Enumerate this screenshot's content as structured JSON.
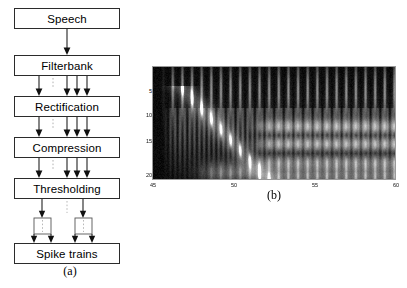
{
  "figure": {
    "panel_a": {
      "caption": "(a)",
      "boxes": [
        {
          "label": "Speech"
        },
        {
          "label": "Filterbank"
        },
        {
          "label": "Rectification"
        },
        {
          "label": "Compression"
        },
        {
          "label": "Thresholding"
        },
        {
          "label": "Spike trains"
        }
      ],
      "connectors": [
        {
          "from": "Speech",
          "to": "Filterbank",
          "arrows": 1,
          "style": "single"
        },
        {
          "from": "Filterbank",
          "to": "Rectification",
          "arrows": 4,
          "style": "multi-with-ellipsis"
        },
        {
          "from": "Rectification",
          "to": "Compression",
          "arrows": 4,
          "style": "multi-with-ellipsis"
        },
        {
          "from": "Compression",
          "to": "Thresholding",
          "arrows": 4,
          "style": "multi-with-ellipsis"
        },
        {
          "from": "Thresholding",
          "to": "Spike trains",
          "arrows": 2,
          "style": "branching-brackets"
        }
      ]
    },
    "panel_b": {
      "caption": "(b)",
      "plot_bg": "#070707",
      "frame_color": "#9a9a9a"
    }
  },
  "chart_data": {
    "type": "heatmap",
    "title": "",
    "subtitle": "",
    "xlabel": "",
    "ylabel": "",
    "xticks": [
      45,
      50,
      55,
      60
    ],
    "yticks": [
      5,
      10,
      15,
      20
    ],
    "xlim": [
      45,
      60
    ],
    "ylim": [
      20,
      1
    ],
    "grid": false,
    "legend": "none",
    "colormap": "gray",
    "features": [
      {
        "name": "formant-sweep",
        "start_x": 47.0,
        "start_y": 5,
        "end_x": 52.0,
        "end_y": 20,
        "intensity": "high"
      },
      {
        "name": "glottal-striations",
        "x_range": [
          45.5,
          60.0
        ],
        "y_range": [
          1,
          9
        ],
        "intensity": "medium"
      },
      {
        "name": "harmonic-bands",
        "x_range": [
          51.5,
          60.0
        ],
        "y_range": [
          9,
          18
        ],
        "intensity": "high"
      },
      {
        "name": "low-channel-band",
        "x_range": [
          48.0,
          60.0
        ],
        "y_range": [
          18,
          20
        ],
        "intensity": "medium"
      }
    ]
  }
}
